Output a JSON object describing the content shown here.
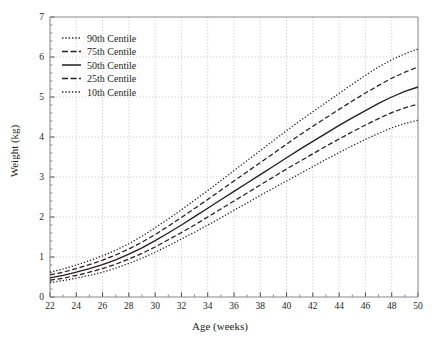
{
  "chart_data": {
    "type": "line",
    "title": "",
    "xlabel": "Age (weeks)",
    "ylabel": "Weight (kg)",
    "xlim": [
      22,
      50
    ],
    "ylim": [
      0,
      7
    ],
    "xticks": [
      22,
      24,
      26,
      28,
      30,
      32,
      34,
      36,
      38,
      40,
      42,
      44,
      46,
      48,
      50
    ],
    "yticks": [
      0,
      1,
      2,
      3,
      4,
      5,
      6,
      7
    ],
    "xtick_labels": [
      "22",
      "24",
      "26",
      "28",
      "30",
      "32",
      "34",
      "36",
      "38",
      "40",
      "42",
      "44",
      "46",
      "48",
      "50"
    ],
    "ytick_labels": [
      "0",
      "1",
      "2",
      "3",
      "4",
      "5",
      "6",
      "7"
    ],
    "x_minor_ticks_per_interval": 2,
    "y_minor_ticks_per_interval": 5,
    "grid": true,
    "grid_style": "dotted",
    "grid_color": "#b9b9b9",
    "legend_position": "upper left",
    "line_color": "#231f20",
    "x": [
      22,
      23,
      24,
      25,
      26,
      27,
      28,
      29,
      30,
      31,
      32,
      33,
      34,
      35,
      36,
      37,
      38,
      39,
      40,
      41,
      42,
      43,
      44,
      45,
      46,
      47,
      48,
      49,
      50
    ],
    "series": [
      {
        "name": "90th Centile",
        "style": "dotted",
        "values": [
          0.62,
          0.7,
          0.8,
          0.91,
          1.03,
          1.17,
          1.33,
          1.52,
          1.73,
          1.95,
          2.18,
          2.42,
          2.66,
          2.91,
          3.16,
          3.41,
          3.66,
          3.91,
          4.16,
          4.4,
          4.63,
          4.86,
          5.09,
          5.32,
          5.54,
          5.75,
          5.93,
          6.08,
          6.2
        ]
      },
      {
        "name": "75th Centile",
        "style": "dashed",
        "values": [
          0.55,
          0.62,
          0.71,
          0.81,
          0.92,
          1.05,
          1.2,
          1.37,
          1.56,
          1.77,
          1.99,
          2.21,
          2.44,
          2.67,
          2.9,
          3.13,
          3.36,
          3.59,
          3.82,
          4.05,
          4.27,
          4.48,
          4.69,
          4.9,
          5.1,
          5.29,
          5.47,
          5.62,
          5.75
        ]
      },
      {
        "name": "50th Centile",
        "style": "solid",
        "values": [
          0.48,
          0.54,
          0.62,
          0.71,
          0.81,
          0.93,
          1.07,
          1.23,
          1.41,
          1.6,
          1.8,
          2.01,
          2.22,
          2.43,
          2.64,
          2.85,
          3.06,
          3.27,
          3.48,
          3.69,
          3.89,
          4.09,
          4.29,
          4.48,
          4.66,
          4.84,
          5.0,
          5.14,
          5.25
        ]
      },
      {
        "name": "25th Centile",
        "style": "dashed",
        "values": [
          0.42,
          0.47,
          0.54,
          0.62,
          0.71,
          0.82,
          0.95,
          1.09,
          1.25,
          1.43,
          1.61,
          1.8,
          2.0,
          2.2,
          2.4,
          2.6,
          2.8,
          3.0,
          3.2,
          3.39,
          3.58,
          3.77,
          3.95,
          4.13,
          4.3,
          4.46,
          4.61,
          4.73,
          4.82
        ]
      },
      {
        "name": "10th Centile",
        "style": "dotted",
        "values": [
          0.36,
          0.41,
          0.47,
          0.54,
          0.62,
          0.72,
          0.84,
          0.97,
          1.12,
          1.28,
          1.45,
          1.62,
          1.8,
          1.98,
          2.17,
          2.35,
          2.54,
          2.72,
          2.9,
          3.08,
          3.26,
          3.44,
          3.61,
          3.78,
          3.94,
          4.09,
          4.23,
          4.34,
          4.42
        ]
      }
    ]
  },
  "legend": {
    "entries": [
      {
        "label": "90th Centile",
        "style": "dotted"
      },
      {
        "label": "75th Centile",
        "style": "dashed"
      },
      {
        "label": "50th Centile",
        "style": "solid"
      },
      {
        "label": "25th Centile",
        "style": "dashed"
      },
      {
        "label": "10th Centile",
        "style": "dotted"
      }
    ]
  },
  "axes": {
    "x_title": "Age (weeks)",
    "y_title": "Weight (kg)"
  }
}
